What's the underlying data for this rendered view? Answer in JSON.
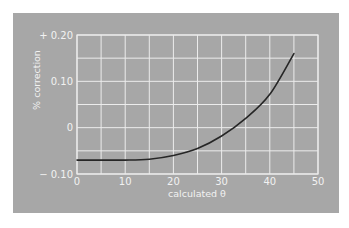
{
  "chart_data": {
    "type": "line",
    "title": "",
    "xlabel": "calculated θ",
    "ylabel": "% correction",
    "xlim": [
      0,
      50
    ],
    "ylim": [
      -0.1,
      0.2
    ],
    "x_ticks": [
      0,
      10,
      20,
      30,
      40,
      50
    ],
    "x_tick_labels": [
      "0",
      "10",
      "20",
      "30",
      "40",
      "50"
    ],
    "y_ticks": [
      -0.1,
      0,
      0.1,
      0.2
    ],
    "y_tick_labels": [
      "− 0.10",
      "0",
      "0.10",
      "+ 0.20"
    ],
    "x_grid_step": 5,
    "y_grid_step": 0.05,
    "grid": true,
    "legend": "none",
    "series": [
      {
        "name": "% correction",
        "x": [
          0,
          5,
          10,
          15,
          20,
          25,
          30,
          35,
          40,
          45
        ],
        "y": [
          -0.07,
          -0.07,
          -0.07,
          -0.068,
          -0.06,
          -0.045,
          -0.018,
          0.02,
          0.072,
          0.16
        ]
      }
    ]
  },
  "colors": {
    "panel": "#a7a7a7",
    "grid": "#ececec",
    "curve": "#262626",
    "text": "#f2f2f2"
  }
}
